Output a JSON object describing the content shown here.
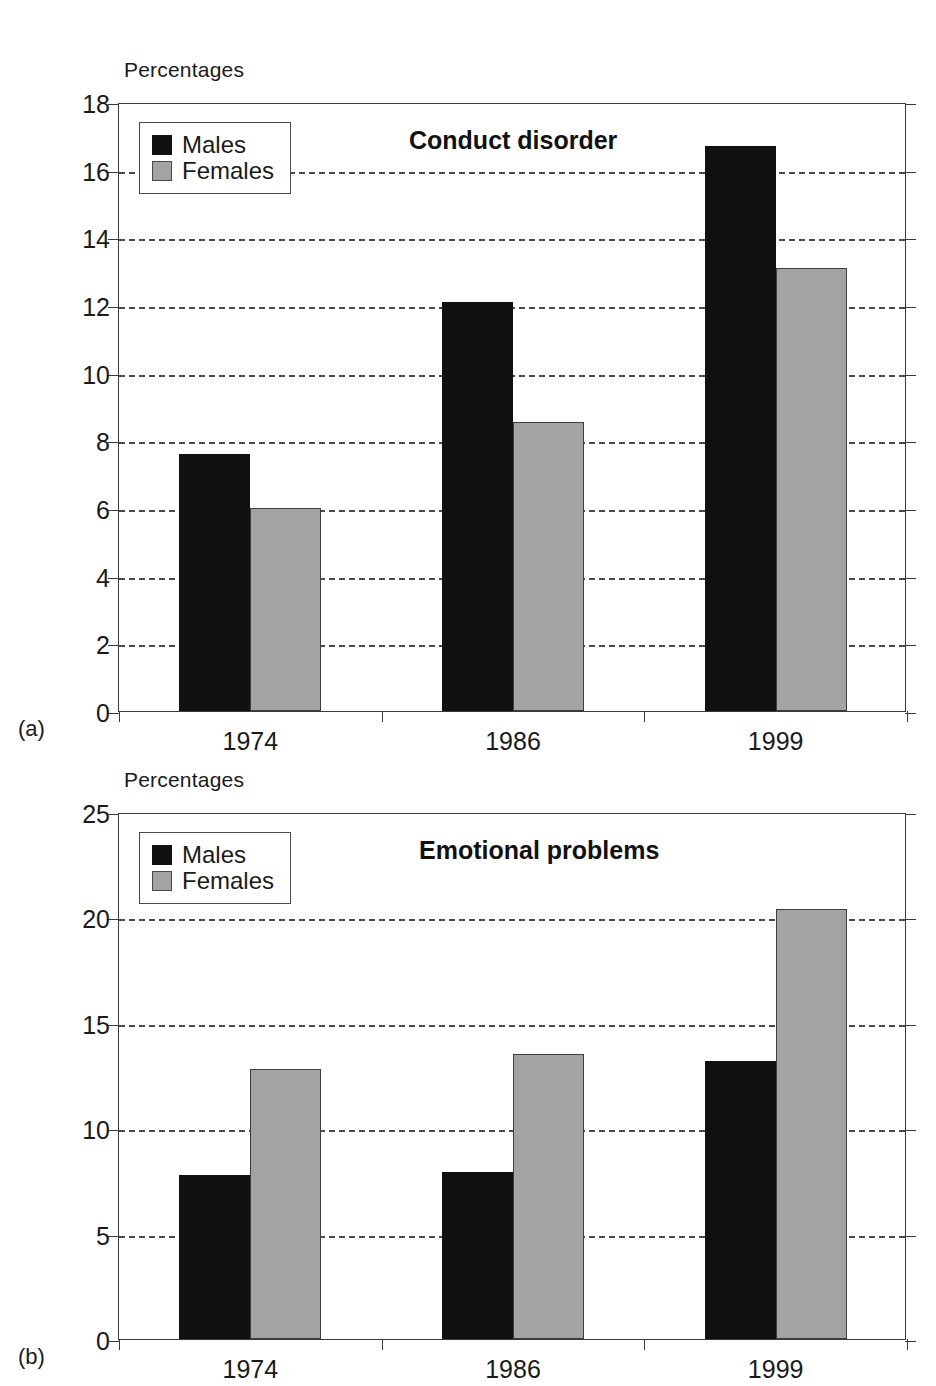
{
  "figure": {
    "panels": [
      {
        "tag": "(a)",
        "axis_unit_label": "Percentages",
        "chart_data": {
          "type": "bar",
          "title": "Conduct disorder",
          "xlabel": "",
          "ylabel": "Percentages",
          "ylim": [
            0,
            18
          ],
          "ytick_step": 2,
          "ytick_labels": [
            "0",
            "2",
            "4",
            "6",
            "8",
            "10",
            "12",
            "14",
            "16",
            "18"
          ],
          "categories": [
            "1974",
            "1986",
            "1999"
          ],
          "grid": true,
          "grid_style": "dashed",
          "legend_position": "top-left",
          "series": [
            {
              "name": "Males",
              "color": "#111111",
              "values": [
                7.6,
                12.1,
                16.7
              ]
            },
            {
              "name": "Females",
              "color": "#a3a3a3",
              "values": [
                6.0,
                8.55,
                13.1
              ]
            }
          ]
        }
      },
      {
        "tag": "(b)",
        "axis_unit_label": "Percentages",
        "chart_data": {
          "type": "bar",
          "title": "Emotional problems",
          "xlabel": "",
          "ylabel": "Percentages",
          "ylim": [
            0,
            25
          ],
          "ytick_step": 5,
          "ytick_labels": [
            "0",
            "5",
            "10",
            "15",
            "20",
            "25"
          ],
          "categories": [
            "1974",
            "1986",
            "1999"
          ],
          "grid": true,
          "grid_style": "dashed",
          "legend_position": "top-left",
          "series": [
            {
              "name": "Males",
              "color": "#111111",
              "values": [
                7.8,
                7.9,
                13.2
              ]
            },
            {
              "name": "Females",
              "color": "#a3a3a3",
              "values": [
                12.8,
                13.5,
                20.4
              ]
            }
          ]
        }
      }
    ]
  }
}
